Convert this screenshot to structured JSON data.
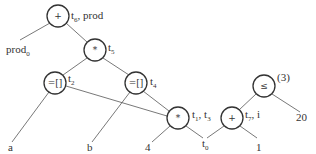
{
  "diagram": {
    "type": "expression-dag",
    "nodes": [
      {
        "id": "plus_top",
        "op": "+",
        "label": "t",
        "label_sub": "6",
        "label_rest": ", prod",
        "cx": 58,
        "cy": 16
      },
      {
        "id": "times_mid",
        "op": "*",
        "label": "t",
        "label_sub": "5",
        "label_rest": "",
        "cx": 95,
        "cy": 50
      },
      {
        "id": "index_left",
        "op": "=[]",
        "label": "t",
        "label_sub": "2",
        "label_rest": "",
        "cx": 55,
        "cy": 83
      },
      {
        "id": "index_right",
        "op": "=[]",
        "label": "t",
        "label_sub": "4",
        "label_rest": "",
        "cx": 136,
        "cy": 83
      },
      {
        "id": "times_low",
        "op": "*",
        "label": "t",
        "label_sub": "1",
        "label_rest": ", t",
        "label_sub2": "3",
        "cx": 178,
        "cy": 118
      },
      {
        "id": "plus_right",
        "op": "+",
        "label": "t",
        "label_sub": "7",
        "label_rest": ", i",
        "cx": 232,
        "cy": 118
      },
      {
        "id": "leq",
        "op": "≤",
        "label": "(3)",
        "cx": 264,
        "cy": 86
      }
    ],
    "leaves": [
      {
        "id": "prod0",
        "text": "prod",
        "sub": "0"
      },
      {
        "id": "a",
        "text": "a"
      },
      {
        "id": "b",
        "text": "b"
      },
      {
        "id": "four",
        "text": "4"
      },
      {
        "id": "t0",
        "text": "t",
        "sub": "0"
      },
      {
        "id": "one",
        "text": "1"
      },
      {
        "id": "twenty",
        "text": "20"
      }
    ],
    "edges": [
      [
        "plus_top",
        "prod0"
      ],
      [
        "plus_top",
        "times_mid"
      ],
      [
        "times_mid",
        "index_left"
      ],
      [
        "times_mid",
        "index_right"
      ],
      [
        "index_left",
        "a"
      ],
      [
        "index_left",
        "times_low"
      ],
      [
        "index_right",
        "b"
      ],
      [
        "index_right",
        "times_low"
      ],
      [
        "times_low",
        "four"
      ],
      [
        "times_low",
        "t0"
      ],
      [
        "plus_right",
        "t0"
      ],
      [
        "plus_right",
        "one"
      ],
      [
        "leq",
        "plus_right"
      ],
      [
        "leq",
        "twenty"
      ]
    ]
  }
}
